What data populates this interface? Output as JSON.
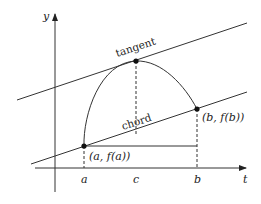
{
  "diagram": {
    "type": "mean value theorem illustration",
    "axes": {
      "y_label": "y",
      "x_label": "t"
    },
    "tick_labels": {
      "a": "a",
      "c": "c",
      "b": "b"
    },
    "point_labels": {
      "a_point": "(a, f(a))",
      "b_point": "(b, f(b))"
    },
    "line_labels": {
      "tangent": "tangent",
      "chord": "chord"
    },
    "colors": {
      "stroke": "#333333",
      "background": "#ffffff"
    }
  }
}
